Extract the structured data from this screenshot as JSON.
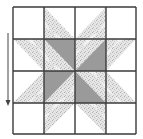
{
  "diagram": {
    "type": "quilt-block",
    "pattern": "eight-pointed-star",
    "grid": {
      "rows": 4,
      "cols": 4
    },
    "colors": {
      "background": "#ffffff",
      "grid_line": "#3a3a3a",
      "dark_fill": "#9a9a9a",
      "speckle_base": "#e4e4e4",
      "speckle_dot": "#b8b8b8",
      "arrow": "#444444"
    },
    "cells": [
      {
        "row": 0,
        "col": 0,
        "fill": "none"
      },
      {
        "row": 0,
        "col": 1,
        "fill": "speckled",
        "triangle": "lower-left"
      },
      {
        "row": 0,
        "col": 2,
        "fill": "speckled",
        "triangle": "lower-right"
      },
      {
        "row": 0,
        "col": 3,
        "fill": "none"
      },
      {
        "row": 1,
        "col": 0,
        "fill": "speckled",
        "triangle": "upper-right"
      },
      {
        "row": 1,
        "col": 1,
        "fill": "dark",
        "triangle": "upper-right",
        "other": "speckled"
      },
      {
        "row": 1,
        "col": 2,
        "fill": "dark",
        "triangle": "lower-right",
        "other": "speckled"
      },
      {
        "row": 1,
        "col": 3,
        "fill": "speckled",
        "triangle": "upper-left"
      },
      {
        "row": 2,
        "col": 0,
        "fill": "speckled",
        "triangle": "lower-right"
      },
      {
        "row": 2,
        "col": 1,
        "fill": "dark",
        "triangle": "upper-left",
        "other": "speckled"
      },
      {
        "row": 2,
        "col": 2,
        "fill": "dark",
        "triangle": "lower-left",
        "other": "speckled"
      },
      {
        "row": 2,
        "col": 3,
        "fill": "speckled",
        "triangle": "lower-left"
      },
      {
        "row": 3,
        "col": 0,
        "fill": "none"
      },
      {
        "row": 3,
        "col": 1,
        "fill": "speckled",
        "triangle": "upper-left"
      },
      {
        "row": 3,
        "col": 2,
        "fill": "speckled",
        "triangle": "upper-right"
      },
      {
        "row": 3,
        "col": 3,
        "fill": "none"
      }
    ],
    "arrow": {
      "direction": "down"
    }
  }
}
